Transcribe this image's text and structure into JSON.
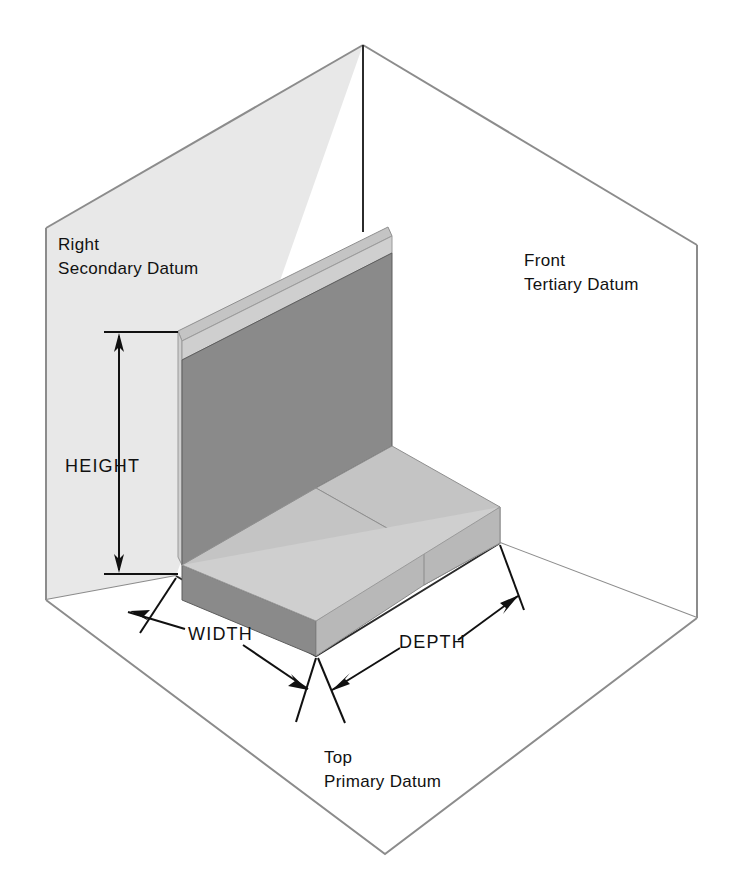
{
  "diagram": {
    "background_color": "#ffffff",
    "planes": [
      {
        "id": "secondary",
        "name_line1": "Right",
        "name_line2": "Secondary Datum",
        "fill_color": "#e8e8e8",
        "edge_color": "#8c8c8c"
      },
      {
        "id": "tertiary",
        "name_line1": "Front",
        "name_line2": "Tertiary Datum",
        "fill_color": "#ffffff",
        "edge_color": "#8c8c8c"
      },
      {
        "id": "primary",
        "name_line1": "Top",
        "name_line2": "Primary Datum",
        "fill_color": "#ffffff",
        "edge_color": "#8c8c8c"
      }
    ],
    "dimensions": [
      {
        "id": "height",
        "label": "HEIGHT",
        "orientation": "vertical"
      },
      {
        "id": "width",
        "label": "WIDTH",
        "orientation": "oblique-left"
      },
      {
        "id": "depth",
        "label": "DEPTH",
        "orientation": "oblique-right"
      }
    ],
    "part": {
      "shape": "L-bracket",
      "face_colors": {
        "wall_front": "#8a8a8a",
        "wall_top": "#c4c4c4",
        "wall_side": "#b8b8b8",
        "base_top": "#c4c4c4",
        "base_front": "#8a8a8a",
        "base_side": "#b8b8b8"
      }
    }
  },
  "labels": {
    "secondary_line1": "Right",
    "secondary_line2": "Secondary Datum",
    "tertiary_line1": "Front",
    "tertiary_line2": "Tertiary Datum",
    "primary_line1": "Top",
    "primary_line2": "Primary Datum",
    "height": "HEIGHT",
    "width": "WIDTH",
    "depth": "DEPTH"
  }
}
